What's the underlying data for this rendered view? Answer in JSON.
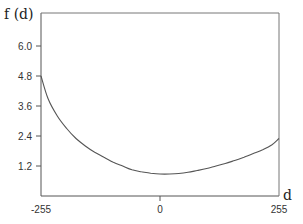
{
  "chart_data": {
    "type": "line",
    "title": "",
    "xlabel": "d",
    "ylabel": "f (d)",
    "xlim": [
      -255,
      255
    ],
    "ylim": [
      0,
      6.6
    ],
    "x_ticks": [
      -255,
      0,
      255
    ],
    "x_tick_labels": [
      "-255",
      "0",
      "255"
    ],
    "y_ticks": [
      1.2,
      2.4,
      3.6,
      4.8,
      6.0
    ],
    "y_tick_labels": [
      "1.2",
      "2.4",
      "3.6",
      "4.8",
      "6.0"
    ],
    "grid": false,
    "legend": null,
    "series": [
      {
        "name": "f(d)",
        "x": [
          -255,
          -240,
          -220,
          -200,
          -180,
          -160,
          -140,
          -120,
          -100,
          -80,
          -60,
          -40,
          -20,
          0,
          20,
          40,
          60,
          80,
          100,
          120,
          140,
          160,
          180,
          200,
          220,
          240,
          255
        ],
        "values": [
          4.8,
          3.9,
          3.2,
          2.7,
          2.3,
          2.0,
          1.75,
          1.55,
          1.35,
          1.2,
          1.05,
          0.97,
          0.91,
          0.88,
          0.88,
          0.9,
          0.95,
          1.02,
          1.1,
          1.2,
          1.3,
          1.42,
          1.55,
          1.7,
          1.85,
          2.05,
          2.3
        ]
      }
    ]
  },
  "labels": {
    "ylabel": "f (d)",
    "xlabel": "d",
    "y_ticks": [
      "1.2",
      "2.4",
      "3.6",
      "4.8",
      "6.0"
    ],
    "x_ticks": [
      "-255",
      "0",
      "255"
    ]
  },
  "colors": {
    "axis": "#555555",
    "curve": "#555555"
  }
}
